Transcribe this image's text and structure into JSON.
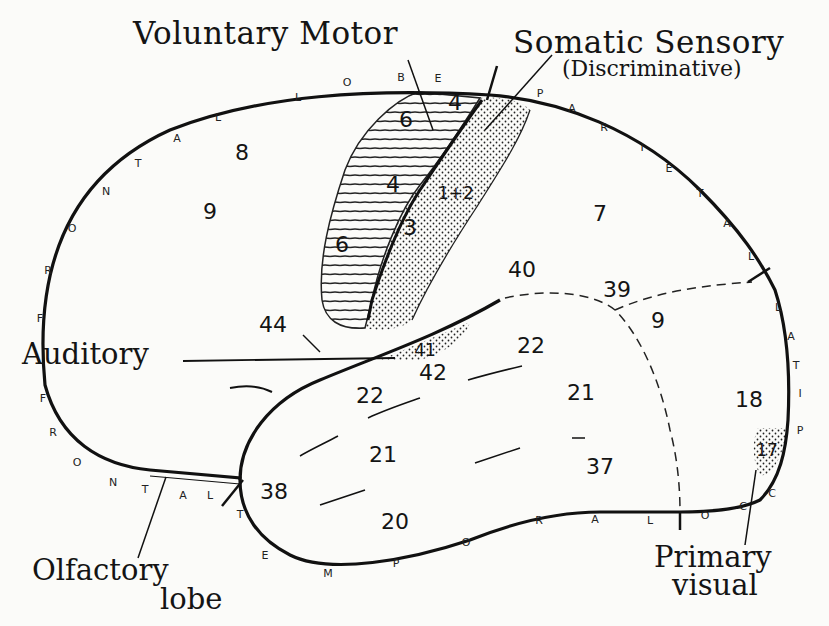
{
  "diagram": {
    "callouts": {
      "voluntary_motor": "Voluntary Motor",
      "somatic_sensory": "Somatic Sensory",
      "somatic_sensory_sub": "(Discriminative)",
      "auditory": "Auditory",
      "olfactory_line1": "Olfactory",
      "olfactory_line2": "lobe",
      "primary_visual_line1": "Primary",
      "primary_visual_line2": "visual"
    },
    "lobes": {
      "frontal_top": [
        "F",
        "R",
        "O",
        "N",
        "T",
        "A",
        "L",
        " ",
        "L",
        "O",
        "B",
        "E"
      ],
      "parietal": [
        "P",
        "A",
        "R",
        "I",
        "E",
        "T",
        "A",
        "L"
      ],
      "occipital_right": [
        "L",
        "A",
        "T",
        "I",
        "P"
      ],
      "occipital_bottom": [
        "C",
        "C",
        "O"
      ],
      "temporal": [
        "T",
        "E",
        "M",
        "P",
        "O",
        "R",
        "A",
        "L"
      ],
      "frontal_bottom": [
        "F",
        "R",
        "O",
        "N",
        "T",
        "A",
        "L"
      ]
    },
    "areas": {
      "a8": "8",
      "a9_frontal": "9",
      "a6_upper": "6",
      "a4_upper": "4",
      "a4_lower": "4",
      "a6_lower": "6",
      "a3": "3",
      "a1_2": "1+2",
      "a7": "7",
      "a40": "40",
      "a39": "39",
      "a9_occ": "9",
      "a44": "44",
      "a41": "41",
      "a42": "42",
      "a22_right": "22",
      "a22_left": "22",
      "a21_right": "21",
      "a21_left": "21",
      "a18": "18",
      "a17": "17",
      "a38": "38",
      "a37": "37",
      "a20": "20"
    },
    "colors": {
      "ink": "#141414",
      "paper": "#fbfbf9"
    }
  }
}
